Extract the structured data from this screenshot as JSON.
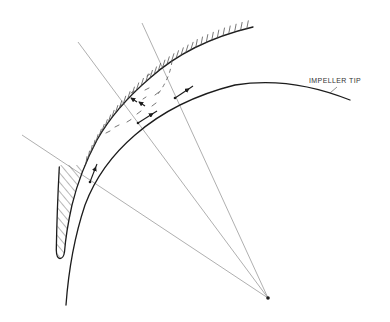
{
  "figure": {
    "labels": {
      "impeller_tip": "IMPELLER TIP"
    }
  },
  "style": {
    "ink": "#1c1c1c",
    "construction_line": "#8c8c8c",
    "background": "#ffffff"
  }
}
